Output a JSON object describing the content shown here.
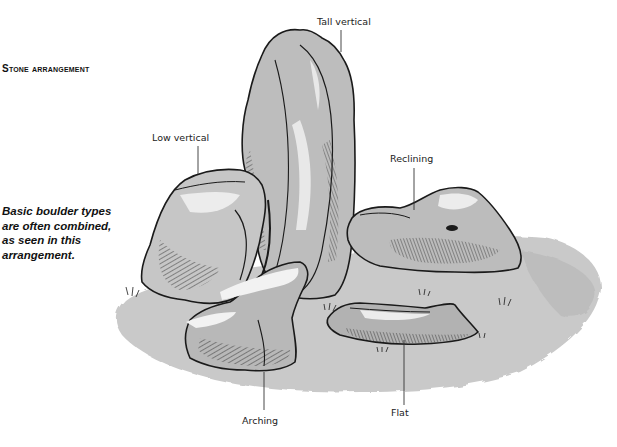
{
  "heading": "Stone arrangement",
  "caption": "Basic boulder types are often combined, as seen in this arrangement.",
  "labels": {
    "tall_vertical": "Tall vertical",
    "low_vertical": "Low vertical",
    "reclining": "Reclining",
    "arching": "Arching",
    "flat": "Flat"
  },
  "colors": {
    "ink": "#1a1a1a",
    "ground_wash": "#c8c8c8",
    "stone_mid": "#b4b4b4",
    "stone_light": "#e6e6e6"
  }
}
